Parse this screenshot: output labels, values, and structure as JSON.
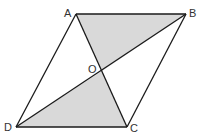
{
  "figure": {
    "type": "parallelogram-with-diagonals",
    "colors": {
      "stroke": "#1a1a1a",
      "shade": "#d9d9d9",
      "background": "#ffffff",
      "label": "#333333"
    },
    "vertices": {
      "A": {
        "label": "A",
        "x": 76,
        "y": 14
      },
      "B": {
        "label": "B",
        "x": 186,
        "y": 14
      },
      "C": {
        "label": "C",
        "x": 127,
        "y": 127
      },
      "D": {
        "label": "D",
        "x": 16,
        "y": 127
      },
      "O": {
        "label": "O",
        "x": 102,
        "y": 71
      }
    },
    "shaded_regions": [
      "triangle AOB",
      "triangle DOC"
    ],
    "segments": [
      "AB",
      "BC",
      "CD",
      "DA",
      "AC",
      "BD"
    ]
  }
}
